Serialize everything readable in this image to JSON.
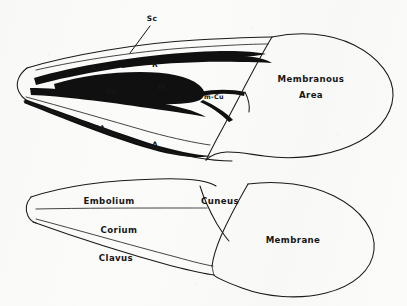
{
  "figure": {
    "background_color": "#fbfbfa",
    "ink_color": "#141414",
    "medium": "pen-and-ink line drawing"
  },
  "upper_diagram": {
    "name": "wing-venation-diagram",
    "caption": "Forewing venation",
    "labels": [
      {
        "id": "sc",
        "text": "Sc",
        "x": 152,
        "y": 19,
        "size": "md",
        "has_leader": true
      },
      {
        "id": "rm",
        "text": "R+M",
        "x": 100,
        "y": 68,
        "size": "sm",
        "has_leader": false
      },
      {
        "id": "r",
        "text": "R",
        "x": 155,
        "y": 65,
        "size": "md",
        "has_leader": false
      },
      {
        "id": "m",
        "text": "M",
        "x": 162,
        "y": 88,
        "size": "md",
        "has_leader": false
      },
      {
        "id": "cu",
        "text": "Cu",
        "x": 112,
        "y": 92,
        "size": "md",
        "has_leader": false
      },
      {
        "id": "mcu",
        "text": "m-Cu",
        "x": 214,
        "y": 97,
        "size": "sm",
        "has_leader": false
      },
      {
        "id": "a1",
        "text": "1A",
        "x": 100,
        "y": 128,
        "size": "sm",
        "has_leader": false
      },
      {
        "id": "a",
        "text": "A",
        "x": 155,
        "y": 145,
        "size": "md",
        "has_leader": false
      }
    ],
    "area_labels": [
      {
        "id": "membranous-area",
        "line1": "Membranous",
        "line2": "Area",
        "x": 311,
        "y": 84
      }
    ]
  },
  "lower_diagram": {
    "name": "wing-regions-diagram",
    "caption": "Forewing regions",
    "labels": [
      {
        "id": "embolium",
        "text": "Embolium",
        "x": 109,
        "y": 201,
        "size": "lg"
      },
      {
        "id": "cuneus",
        "text": "Cuneus",
        "x": 220,
        "y": 201,
        "size": "lg"
      },
      {
        "id": "corium",
        "text": "Corium",
        "x": 119,
        "y": 230,
        "size": "lg"
      },
      {
        "id": "clavus",
        "text": "Clavus",
        "x": 116,
        "y": 258,
        "size": "lg"
      },
      {
        "id": "membrane",
        "text": "Membrane",
        "x": 293,
        "y": 240,
        "size": "lg"
      }
    ]
  }
}
